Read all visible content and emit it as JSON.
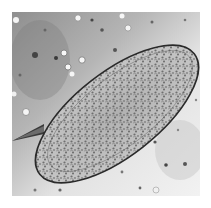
{
  "image": {
    "subject": "microscopy photo of an oval egg with a lateral spine",
    "alt": "Grayscale light-microscope image of an elongated oval egg with a sharp lateral spine, granular interior, on a speckled background",
    "colors": {
      "border": "#ffffff",
      "background_light": "#e6e6e6",
      "background_dark": "#9a9a9a",
      "egg_fill": "#b8b8b8",
      "egg_outline": "#2a2a2a",
      "granules": "#5a5a5a"
    }
  }
}
